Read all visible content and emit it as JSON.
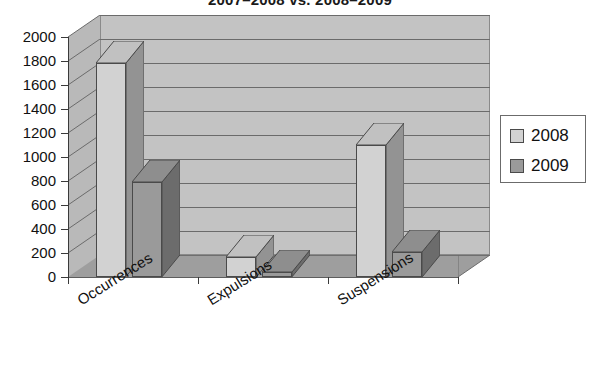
{
  "chart_data": {
    "type": "bar",
    "title": "2007–2008 vs. 2008–2009",
    "xlabel": "",
    "ylabel": "",
    "ylim": [
      0,
      2000
    ],
    "ytick_step": 200,
    "yticks": [
      "2000",
      "1800",
      "1600",
      "1400",
      "1200",
      "1000",
      "800",
      "600",
      "400",
      "200",
      "0"
    ],
    "grid": true,
    "three_d": true,
    "legend_position": "right",
    "categories": [
      "Occurrences",
      "Expulsions",
      "Suspensions"
    ],
    "series": [
      {
        "name": "2008",
        "color": "#d2d2d2",
        "values": [
          1780,
          170,
          1100
        ]
      },
      {
        "name": "2009",
        "color": "#9a9a9a",
        "values": [
          790,
          40,
          210
        ]
      }
    ]
  },
  "legend": {
    "items": [
      {
        "label": "2008",
        "swatch_color": "#d2d2d2"
      },
      {
        "label": "2009",
        "swatch_color": "#9a9a9a"
      }
    ]
  },
  "colors": {
    "plot_background": "#c3c3c3",
    "left_wall": "#b9b9b9",
    "floor": "#9e9e9e",
    "gridline": "#6b6b6b",
    "axis": "#3a3a3a",
    "series_2008": "#d2d2d2",
    "series_2009": "#9a9a9a",
    "page_background": "#ffffff",
    "text": "#111111"
  }
}
